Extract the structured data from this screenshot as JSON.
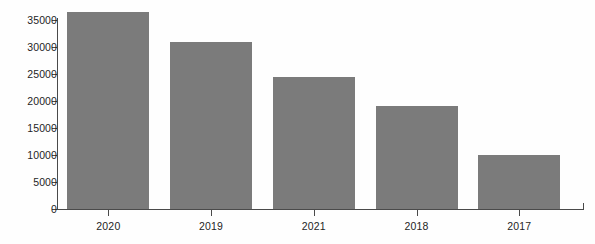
{
  "chart_data": {
    "type": "bar",
    "title": "",
    "subtitle": "",
    "xlabel": "",
    "ylabel": "",
    "categories": [
      "2020",
      "2019",
      "2021",
      "2018",
      "2017"
    ],
    "values": [
      36500,
      31000,
      24500,
      19000,
      10000
    ],
    "series": [
      {
        "name": "",
        "values": [
          36500,
          31000,
          24500,
          19000,
          10000
        ]
      }
    ],
    "ylim": [
      0,
      35000
    ],
    "y_ticks": [
      0,
      5000,
      10000,
      15000,
      20000,
      25000,
      30000,
      35000
    ],
    "y_tick_labels": [
      "0",
      "5000",
      "10000",
      "15000",
      "20000",
      "25000",
      "30000",
      "35000"
    ],
    "x_tick_labels": [
      "2020",
      "2019",
      "2021",
      "2018",
      "2017"
    ],
    "grid": false,
    "legend": false,
    "legend_position": "none",
    "annotations": [],
    "bar_color": "#7b7b7b",
    "axis_color": "#4a4a4a",
    "background_color": "#fefefe"
  }
}
